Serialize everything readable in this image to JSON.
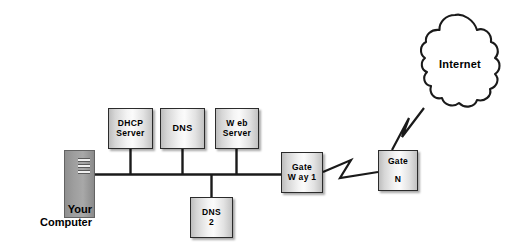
{
  "diagram": {
    "background_color": "#ffffff",
    "line_color": "#1a1a1a",
    "box_border_color": "#2b2b2b",
    "tower_color": "#9e9e9e"
  },
  "computer": {
    "caption": "Your\nComputer",
    "icon": "desktop-tower-icon"
  },
  "nodes": {
    "dhcp": {
      "label": "DHCP\nServer"
    },
    "dns": {
      "label": "DNS"
    },
    "web": {
      "label": "W eb\nServer"
    },
    "dns2": {
      "label": "DNS\n2"
    },
    "gateway1": {
      "label": "Gate\nW ay 1"
    },
    "gatewayn": {
      "label": "Gate\n\nN"
    }
  },
  "cloud": {
    "label": "Internet",
    "icon": "cloud-icon"
  },
  "links": [
    {
      "from": "computer",
      "to": "bus",
      "style": "solid"
    },
    {
      "from": "dhcp",
      "to": "bus",
      "style": "solid"
    },
    {
      "from": "dns",
      "to": "bus",
      "style": "solid"
    },
    {
      "from": "web",
      "to": "bus",
      "style": "solid"
    },
    {
      "from": "dns2",
      "to": "bus",
      "style": "solid"
    },
    {
      "from": "bus",
      "to": "gateway1",
      "style": "solid"
    },
    {
      "from": "gateway1",
      "to": "gatewayn",
      "style": "lightning"
    },
    {
      "from": "gatewayn",
      "to": "cloud",
      "style": "lightning"
    }
  ]
}
